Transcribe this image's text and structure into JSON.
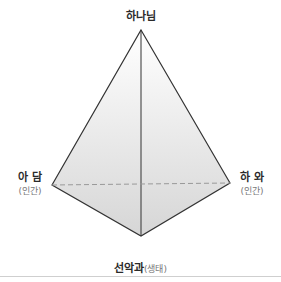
{
  "diagram": {
    "nodes": {
      "top": {
        "label": "하나님"
      },
      "left": {
        "label": "아 담",
        "sublabel": "(인간)"
      },
      "right": {
        "label": "하 와",
        "sublabel": "(인간)"
      },
      "bottom": {
        "label": "선악과",
        "sublabel": "(생태)"
      }
    },
    "colors": {
      "stroke": "#333333",
      "fill_top": "#ffffff",
      "fill_bottom": "#d9d9d9",
      "dash": "#999999",
      "rule": "#cfcfcf"
    }
  }
}
